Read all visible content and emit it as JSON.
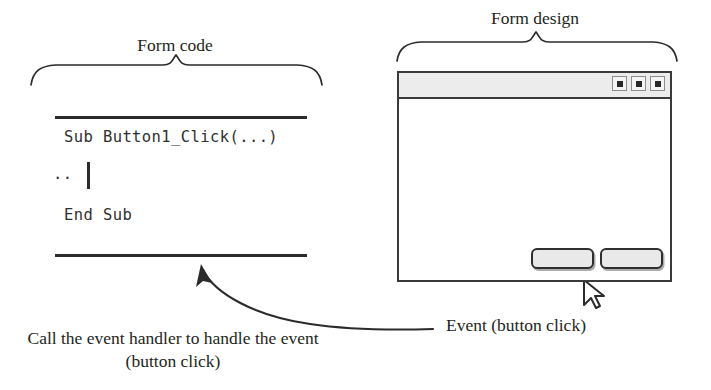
{
  "diagram": {
    "ink_color": "#231f20",
    "line_color": "#2b2b2b",
    "button_fill": "#e9e9e9",
    "titlebar_fill": "#ececec"
  },
  "braces": {
    "form_code": {
      "label": "Form code",
      "span_left": 30,
      "span_right": 322
    },
    "form_design": {
      "label": "Form design",
      "span_left": 396,
      "span_right": 678
    }
  },
  "code_block": {
    "lines": [
      "Sub Button1_Click(...)",
      "..",
      "End Sub"
    ],
    "line_1": "Sub Button1_Click(...)",
    "line_2": "..",
    "line_3": "End Sub",
    "caret": "text-cursor"
  },
  "form_window": {
    "titlebar": {
      "buttons": [
        {
          "name": "minimize-button",
          "glyph": "square"
        },
        {
          "name": "maximize-button",
          "glyph": "square"
        },
        {
          "name": "close-button",
          "glyph": "square"
        }
      ]
    },
    "buttons": [
      {
        "name": "form-button-1",
        "label": ""
      },
      {
        "name": "form-button-2",
        "label": ""
      }
    ],
    "cursor": "mouse-pointer"
  },
  "annotations": {
    "event_label": "Event (button click)",
    "call_caption": "Call the event handler to handle the event (button click)"
  }
}
